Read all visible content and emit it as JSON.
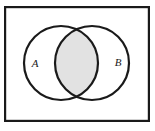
{
  "figure": {
    "kind": "venn-diagram",
    "caption": "",
    "universal_set_frame": {
      "name": "universal-set-rectangle",
      "x": 4,
      "y": 6,
      "width": 146,
      "height": 116,
      "stroke_color": "#1a1a1a",
      "stroke_width": 2.2,
      "fill_color": "#ffffff"
    },
    "background_color": "#ffffff",
    "circles": [
      {
        "id": "set-a",
        "label": "A",
        "cx": 61,
        "cy": 63,
        "r": 37,
        "stroke_color": "#1a1a1a",
        "stroke_width": 2.2,
        "fill_color": "#ffffff",
        "label_x": 35,
        "label_y": 63,
        "label_font_size": 11
      },
      {
        "id": "set-b",
        "label": "B",
        "cx": 92,
        "cy": 63,
        "r": 37,
        "stroke_color": "#1a1a1a",
        "stroke_width": 2.2,
        "fill_color": "#ffffff",
        "label_x": 118,
        "label_y": 62,
        "label_font_size": 11
      }
    ],
    "shaded_region": {
      "id": "intersection-lens",
      "name": "A-intersect-B",
      "description": "intersection",
      "fill_color": "#e2e2e2",
      "stroke_color": "#1a1a1a",
      "stroke_width": 2.2
    }
  }
}
